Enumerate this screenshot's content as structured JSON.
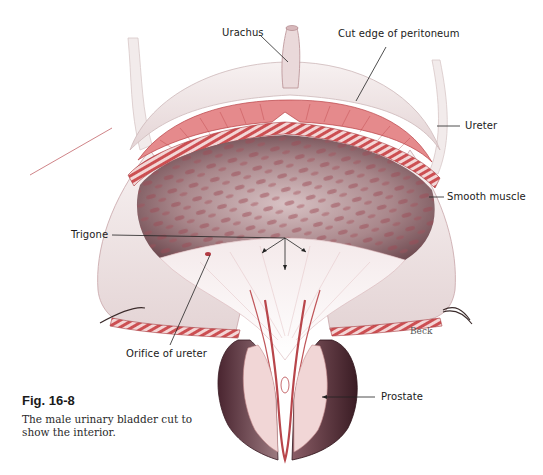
{
  "figure": {
    "number": "Fig. 16-8",
    "caption": "The male urinary bladder cut to show the interior.",
    "signature": "Beck"
  },
  "labels": {
    "urachus": "Urachus",
    "cut_edge": "Cut edge of peritoneum",
    "ureter": "Ureter",
    "smooth_muscle": "Smooth muscle",
    "trigone": "Trigone",
    "orifice": "Orifice of ureter",
    "prostate": "Prostate"
  },
  "colors": {
    "muscle_red": "#c8474a",
    "mucosa": "#b58c8f",
    "serosa": "#efe6e6",
    "prostate_dark": "#5a2f36",
    "leader_line": "#222222"
  }
}
